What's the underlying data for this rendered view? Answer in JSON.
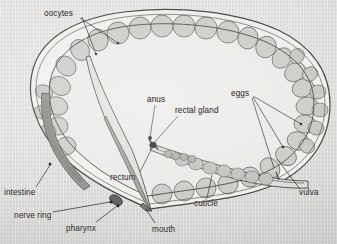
{
  "figure": {
    "background_color": "#d9d8d5",
    "ink_color": "#2a2a28",
    "body_fill": "#f0efec",
    "cell_fill": "#c9c7c3",
    "intestine_fill": "#8f8d8a",
    "pharynx_fill": "#a9a7a3",
    "leader_color": "#232321"
  },
  "labels": [
    {
      "id": "oocytes",
      "text": "oocytes",
      "x": 44,
      "y": 9,
      "name": "label-oocytes"
    },
    {
      "id": "anus",
      "text": "anus",
      "x": 147,
      "y": 95,
      "name": "label-anus"
    },
    {
      "id": "rectal_gland",
      "text": "rectal gland",
      "x": 175,
      "y": 106,
      "name": "label-rectal-gland"
    },
    {
      "id": "eggs",
      "text": "eggs",
      "x": 231,
      "y": 89,
      "name": "label-eggs"
    },
    {
      "id": "rectum",
      "text": "rectum",
      "x": 110,
      "y": 173,
      "name": "label-rectum"
    },
    {
      "id": "cuticle",
      "text": "cuticle",
      "x": 194,
      "y": 199,
      "name": "label-cuticle"
    },
    {
      "id": "vulva",
      "text": "vulva",
      "x": 299,
      "y": 188,
      "name": "label-vulva"
    },
    {
      "id": "intestine",
      "text": "intestine",
      "x": 4,
      "y": 188,
      "name": "label-intestine"
    },
    {
      "id": "nerve_ring",
      "text": "nerve ring",
      "x": 14,
      "y": 211,
      "name": "label-nerve-ring"
    },
    {
      "id": "pharynx",
      "text": "pharynx",
      "x": 66,
      "y": 224,
      "name": "label-pharynx"
    },
    {
      "id": "mouth",
      "text": "mouth",
      "x": 152,
      "y": 225,
      "name": "label-mouth"
    }
  ],
  "leader_lines": [
    {
      "id": "oocytes-a",
      "from": [
        80,
        18
      ],
      "to": [
        118,
        43
      ],
      "name": "leader-oocytes-a"
    },
    {
      "id": "oocytes-b",
      "from": [
        82,
        17
      ],
      "to": [
        96,
        54
      ],
      "name": "leader-oocytes-b"
    },
    {
      "id": "anus",
      "from": [
        155,
        105
      ],
      "to": [
        150,
        137
      ],
      "name": "leader-anus"
    },
    {
      "id": "rectal",
      "from": [
        178,
        116
      ],
      "to": [
        153,
        144
      ],
      "name": "leader-rectal-gland"
    },
    {
      "id": "rectum",
      "from": [
        140,
        172
      ],
      "to": [
        152,
        148
      ],
      "name": "leader-rectum"
    },
    {
      "id": "eggs-a",
      "from": [
        253,
        96
      ],
      "to": [
        301,
        124
      ],
      "name": "leader-eggs-a"
    },
    {
      "id": "eggs-b",
      "from": [
        253,
        97
      ],
      "to": [
        283,
        147
      ],
      "name": "leader-eggs-b"
    },
    {
      "id": "eggs-c",
      "from": [
        252,
        98
      ],
      "to": [
        274,
        168
      ],
      "name": "leader-eggs-c"
    },
    {
      "id": "vulva",
      "from": [
        300,
        189
      ],
      "to": [
        277,
        159
      ],
      "name": "leader-vulva"
    },
    {
      "id": "cuticle",
      "from": [
        207,
        198
      ],
      "to": [
        212,
        175
      ],
      "name": "leader-cuticle"
    },
    {
      "id": "intestine",
      "from": [
        36,
        187
      ],
      "to": [
        50,
        165
      ],
      "name": "leader-intestine"
    },
    {
      "id": "nerveRing",
      "from": [
        53,
        212
      ],
      "to": [
        110,
        202
      ],
      "name": "leader-nerve-ring"
    },
    {
      "id": "pharynx",
      "from": [
        96,
        222
      ],
      "to": [
        117,
        206
      ],
      "name": "leader-pharynx"
    },
    {
      "id": "mouth",
      "from": [
        155,
        223
      ],
      "to": [
        146,
        209
      ],
      "name": "leader-mouth"
    }
  ],
  "markers": [
    {
      "id": "oocyte-dot-1",
      "x": 118,
      "y": 43,
      "r": 1.3,
      "name": "marker-oocyte-1"
    },
    {
      "id": "oocyte-dot-2",
      "x": 96,
      "y": 54,
      "r": 1.3,
      "name": "marker-oocyte-2"
    },
    {
      "id": "anus-dot",
      "x": 150,
      "y": 138,
      "r": 1.6,
      "name": "marker-anus"
    },
    {
      "id": "rectal-dot",
      "x": 153,
      "y": 145,
      "r": 2.2,
      "name": "marker-rectal-gland"
    },
    {
      "id": "egg-dot-1",
      "x": 301,
      "y": 124,
      "r": 1.3,
      "name": "marker-egg-1"
    },
    {
      "id": "egg-dot-2",
      "x": 283,
      "y": 147,
      "r": 1.3,
      "name": "marker-egg-2"
    },
    {
      "id": "intest-dot",
      "x": 50,
      "y": 164,
      "r": 1.5,
      "name": "marker-intestine"
    },
    {
      "id": "nerve-dot",
      "x": 111,
      "y": 202,
      "r": 1.6,
      "name": "marker-nerve-ring"
    },
    {
      "id": "pharynx-dot",
      "x": 118,
      "y": 206,
      "r": 1.4,
      "name": "marker-pharynx"
    }
  ],
  "anatomy_parts": [
    "cuticle",
    "oocytes",
    "eggs",
    "vulva",
    "intestine",
    "nerve ring",
    "pharynx",
    "mouth",
    "rectum",
    "rectal gland",
    "anus"
  ]
}
